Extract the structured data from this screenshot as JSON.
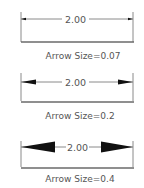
{
  "diagram": {
    "colors": {
      "line": "#8a8a8a",
      "base_line": "#6a6a6a",
      "arrow": "#111111",
      "text": "#555555",
      "background": "#ffffff"
    },
    "panels": [
      {
        "dimension_text": "2.00",
        "label": "Arrow Size=0.07",
        "arrow_size": 0.07
      },
      {
        "dimension_text": "2.00",
        "label": "Arrow Size=0.2",
        "arrow_size": 0.2
      },
      {
        "dimension_text": "2.00",
        "label": "Arrow Size=0.4",
        "arrow_size": 0.4
      }
    ]
  }
}
